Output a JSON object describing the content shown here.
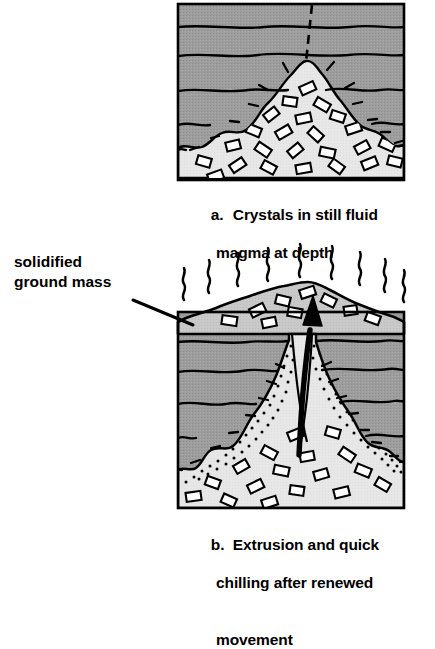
{
  "figure": {
    "kind": "geology-cross-section-diagram",
    "background_color": "#ffffff",
    "ink_color": "#000000"
  },
  "colors": {
    "rock_layer_gray": "#9d9d9d",
    "magma_light": "#e6e6e6",
    "ground_mass_gray": "#c9c9c9",
    "crystal_fill": "#ffffff",
    "outline": "#000000"
  },
  "labels": {
    "solidified_ground_mass": "solidified\nground mass"
  },
  "panels": [
    {
      "id": "a",
      "marker": "a.",
      "caption_line1": "Crystals in still fluid",
      "caption_line2": "magma at depth",
      "features": [
        "layered sedimentary rock (5 strata)",
        "dashed future conduit line from surface to magma apex",
        "intrusive magma body with suspended crystals",
        "radiating contact heat ticks around magma margin"
      ],
      "strata_count": 5,
      "crystal_count": 24,
      "heat_tick_count": 12,
      "dashed_line": true,
      "stipple": false,
      "arrow": false,
      "vapor_lines": 0
    },
    {
      "id": "b",
      "marker": "b.",
      "caption_line1": "Extrusion and quick",
      "caption_line2": "chilling after renewed",
      "caption_line3": "movement",
      "features": [
        "extruded solidified ground mass cone above surface",
        "rising wavy vapor / heat lines",
        "stippled chilled conduit margins",
        "thick black arrow showing upward magma movement",
        "crystals in both cone and chamber"
      ],
      "strata_count": 5,
      "crystal_count": 26,
      "heat_tick_count": 14,
      "dashed_line": false,
      "stipple": true,
      "arrow": true,
      "vapor_lines": 9
    }
  ]
}
